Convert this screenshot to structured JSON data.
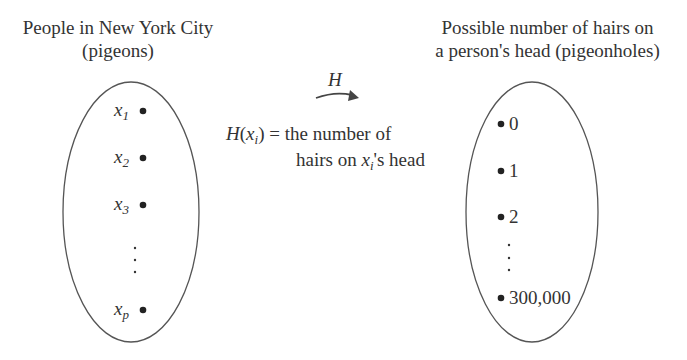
{
  "left_set": {
    "title_line1": "People in New York City",
    "title_line2": "(pigeons)",
    "elements": [
      {
        "var": "x",
        "sub": "1"
      },
      {
        "var": "x",
        "sub": "2"
      },
      {
        "var": "x",
        "sub": "3"
      },
      {
        "var": "x",
        "sub": "p"
      }
    ],
    "ellipsis": "⋮"
  },
  "right_set": {
    "title_line1": "Possible number of hairs on",
    "title_line2": "a person's head (pigeonholes)",
    "elements": [
      "0",
      "1",
      "2",
      "300,000"
    ],
    "ellipsis": "⋮"
  },
  "mapping": {
    "arrow_label": "H",
    "definition": {
      "func": "H",
      "arg_var": "x",
      "arg_sub": "i",
      "line1_rest": " = the number of",
      "line2_pre": "hairs on ",
      "line2_var": "x",
      "line2_sub": "i",
      "line2_post": "'s head"
    }
  },
  "colors": {
    "stroke": "#555555",
    "text": "#333333",
    "dot": "#222222"
  }
}
